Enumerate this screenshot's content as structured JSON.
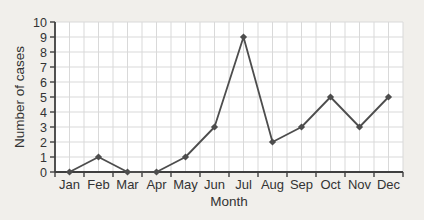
{
  "chart_data": {
    "type": "line",
    "categories": [
      "Jan",
      "Feb",
      "Mar",
      "Apr",
      "May",
      "Jun",
      "Jul",
      "Aug",
      "Sep",
      "Oct",
      "Nov",
      "Dec"
    ],
    "values": [
      0,
      1,
      0,
      0,
      1,
      3,
      9,
      2,
      3,
      5,
      3,
      5
    ],
    "series_name": "cases",
    "title": "",
    "xlabel": "Month",
    "ylabel": "Number of cases",
    "ylim": [
      0,
      10
    ],
    "ytick_step": 1,
    "grid": "on",
    "legend": "none",
    "marker": "diamond"
  },
  "colors": {
    "page_background": "#f1efeb",
    "plot_background": "#ffffff",
    "grid": "#d9d9d9",
    "axis": "#3f3f3f",
    "series": "#4d4d4d",
    "text": "#333333"
  }
}
